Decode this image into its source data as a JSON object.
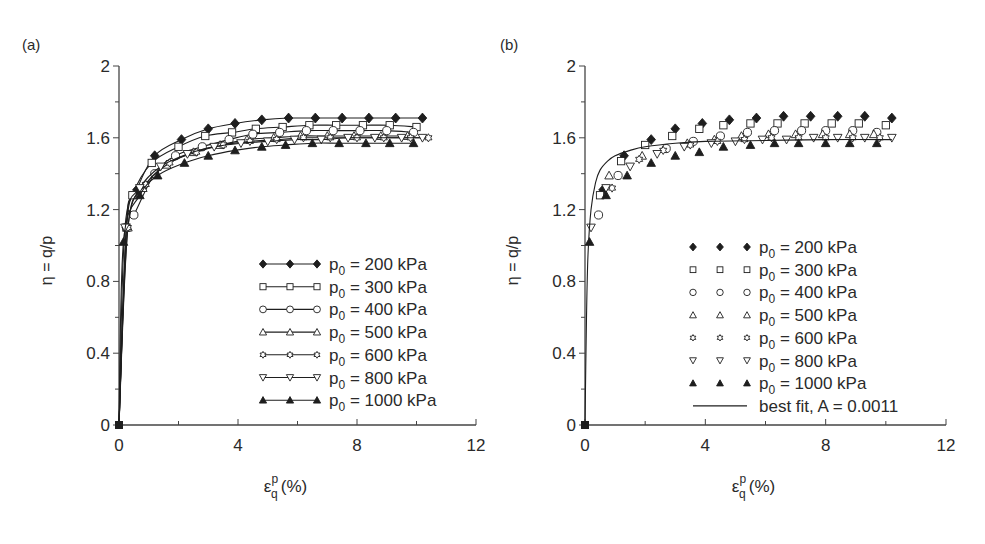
{
  "panels": [
    {
      "id": "a",
      "label": "(a)",
      "legend_style": "line-markers",
      "x_axis_label": "ε",
      "x_axis_sup": "p",
      "x_axis_sub": "q",
      "x_axis_unit": "(%)",
      "y_axis_label": "η = q/p"
    },
    {
      "id": "b",
      "label": "(b)",
      "legend_style": "markers-only",
      "x_axis_label": "ε",
      "x_axis_sup": "p",
      "x_axis_sub": "q",
      "x_axis_unit": "(%)",
      "y_axis_label": "η = q/p"
    }
  ],
  "legend": [
    {
      "marker": "filled-diamond",
      "prefix": "p",
      "sub": "0",
      "text": " = 200 kPa"
    },
    {
      "marker": "open-square",
      "prefix": "p",
      "sub": "0",
      "text": " = 300 kPa"
    },
    {
      "marker": "open-circle",
      "prefix": "p",
      "sub": "0",
      "text": " = 400 kPa"
    },
    {
      "marker": "open-triangle-up",
      "prefix": "p",
      "sub": "0",
      "text": " = 500 kPa"
    },
    {
      "marker": "open-star",
      "prefix": "p",
      "sub": "0",
      "text": " = 600 kPa"
    },
    {
      "marker": "open-triangle-down",
      "prefix": "p",
      "sub": "0",
      "text": " = 800 kPa"
    },
    {
      "marker": "filled-triangle-up",
      "prefix": "p",
      "sub": "0",
      "text": " = 1000 kPa"
    }
  ],
  "best_fit_label": "best fit, A = 0.0011",
  "chart_data": [
    {
      "type": "line",
      "title": "(a)",
      "xlabel": "ε_q^p (%)",
      "ylabel": "η = q/p",
      "xlim": [
        0,
        12
      ],
      "ylim": [
        0,
        2
      ],
      "xticks": [
        0,
        4,
        8,
        12
      ],
      "yticks": [
        0,
        0.4,
        0.8,
        1.2,
        1.6,
        2
      ],
      "grid": false,
      "legend_position": "lower right",
      "series": [
        {
          "name": "p0 = 200 kPa",
          "marker": "filled-diamond",
          "x": [
            0,
            0.25,
            0.6,
            1.2,
            2.1,
            3.0,
            3.9,
            4.8,
            5.7,
            6.6,
            7.5,
            8.4,
            9.3,
            10.2
          ],
          "y": [
            0,
            1.1,
            1.31,
            1.5,
            1.59,
            1.65,
            1.68,
            1.7,
            1.71,
            1.71,
            1.71,
            1.71,
            1.71,
            1.71
          ]
        },
        {
          "name": "p0 = 300 kPa",
          "marker": "open-square",
          "x": [
            0,
            0.25,
            0.45,
            1.1,
            2.0,
            2.9,
            3.8,
            4.6,
            5.5,
            6.4,
            7.3,
            8.2,
            9.1,
            10.0
          ],
          "y": [
            0,
            1.1,
            1.28,
            1.46,
            1.55,
            1.61,
            1.63,
            1.65,
            1.66,
            1.67,
            1.67,
            1.67,
            1.67,
            1.66
          ]
        },
        {
          "name": "p0 = 400 kPa",
          "marker": "open-circle",
          "x": [
            0,
            0.25,
            0.5,
            1.2,
            1.9,
            2.8,
            3.7,
            4.5,
            5.4,
            6.3,
            7.2,
            8.1,
            9.0,
            9.9
          ],
          "y": [
            0,
            1.1,
            1.17,
            1.4,
            1.5,
            1.55,
            1.59,
            1.62,
            1.63,
            1.64,
            1.64,
            1.64,
            1.64,
            1.63
          ]
        },
        {
          "name": "p0 = 500 kPa",
          "marker": "open-triangle-up",
          "x": [
            0,
            0.3,
            0.8,
            1.6,
            2.5,
            3.4,
            4.3,
            5.2,
            6.1,
            7.0,
            7.9,
            8.8,
            9.7
          ],
          "y": [
            0,
            1.1,
            1.32,
            1.45,
            1.52,
            1.56,
            1.59,
            1.6,
            1.61,
            1.61,
            1.61,
            1.61,
            1.61
          ]
        },
        {
          "name": "p0 = 600 kPa",
          "marker": "open-star",
          "x": [
            0,
            0.3,
            0.9,
            1.7,
            2.6,
            3.5,
            4.4,
            5.3,
            6.2,
            7.1,
            8.0,
            8.9,
            9.8,
            10.4
          ],
          "y": [
            0,
            1.1,
            1.34,
            1.46,
            1.52,
            1.56,
            1.58,
            1.59,
            1.6,
            1.6,
            1.6,
            1.6,
            1.6,
            1.6
          ]
        },
        {
          "name": "p0 = 800 kPa",
          "marker": "open-triangle-down",
          "x": [
            0,
            0.2,
            0.7,
            1.4,
            2.3,
            3.2,
            4.1,
            5.0,
            5.9,
            6.8,
            7.7,
            8.6,
            9.5,
            10.2
          ],
          "y": [
            0,
            1.1,
            1.32,
            1.44,
            1.51,
            1.55,
            1.57,
            1.58,
            1.59,
            1.59,
            1.6,
            1.6,
            1.6,
            1.6
          ]
        },
        {
          "name": "p0 = 1000 kPa",
          "marker": "filled-triangle-up",
          "x": [
            0,
            0.15,
            0.7,
            1.3,
            2.2,
            3.0,
            3.9,
            4.8,
            5.6,
            6.5,
            7.4,
            8.3,
            9.1,
            9.9
          ],
          "y": [
            0,
            1.02,
            1.28,
            1.39,
            1.46,
            1.5,
            1.53,
            1.55,
            1.56,
            1.57,
            1.57,
            1.57,
            1.57,
            1.57
          ]
        }
      ]
    },
    {
      "type": "scatter",
      "title": "(b)",
      "xlabel": "ε_q^p (%)",
      "ylabel": "η = q/p",
      "xlim": [
        0,
        12
      ],
      "ylim": [
        0,
        2
      ],
      "xticks": [
        0,
        4,
        8,
        12
      ],
      "yticks": [
        0,
        0.4,
        0.8,
        1.2,
        1.6,
        2
      ],
      "grid": false,
      "legend_position": "lower right",
      "series": [
        {
          "name": "p0 = 200 kPa",
          "marker": "filled-diamond",
          "x": [
            0,
            0.6,
            1.3,
            2.2,
            3.0,
            3.9,
            4.8,
            5.7,
            6.6,
            7.5,
            8.4,
            9.3,
            10.2
          ],
          "y": [
            0,
            1.31,
            1.5,
            1.59,
            1.65,
            1.68,
            1.7,
            1.71,
            1.72,
            1.72,
            1.72,
            1.72,
            1.71
          ]
        },
        {
          "name": "p0 = 300 kPa",
          "marker": "open-square",
          "x": [
            0,
            0.5,
            1.2,
            2.0,
            2.9,
            3.8,
            4.6,
            5.5,
            6.4,
            7.3,
            8.2,
            9.1,
            10.0
          ],
          "y": [
            0,
            1.28,
            1.47,
            1.56,
            1.61,
            1.65,
            1.67,
            1.68,
            1.68,
            1.68,
            1.68,
            1.68,
            1.67
          ]
        },
        {
          "name": "p0 = 400 kPa",
          "marker": "open-circle",
          "x": [
            0,
            0.45,
            1.1,
            2.7,
            3.6,
            4.5,
            5.4,
            6.3,
            7.2,
            8.0,
            8.9,
            9.7
          ],
          "y": [
            0,
            1.17,
            1.39,
            1.54,
            1.58,
            1.61,
            1.63,
            1.64,
            1.64,
            1.64,
            1.64,
            1.63
          ]
        },
        {
          "name": "p0 = 500 kPa",
          "marker": "open-triangle-up",
          "x": [
            0,
            0.8,
            1.9,
            3.4,
            4.3,
            5.2,
            6.1,
            7.0,
            7.9,
            8.8,
            9.6
          ],
          "y": [
            0,
            1.39,
            1.5,
            1.57,
            1.59,
            1.61,
            1.62,
            1.62,
            1.62,
            1.62,
            1.62
          ]
        },
        {
          "name": "p0 = 600 kPa",
          "marker": "open-star",
          "x": [
            0,
            0.9,
            1.8,
            2.6,
            3.5,
            4.4,
            5.3,
            6.2,
            7.1,
            8.0,
            8.9,
            9.8
          ],
          "y": [
            0,
            1.32,
            1.48,
            1.53,
            1.56,
            1.58,
            1.59,
            1.6,
            1.6,
            1.6,
            1.6,
            1.6
          ]
        },
        {
          "name": "p0 = 800 kPa",
          "marker": "open-triangle-down",
          "x": [
            0,
            0.2,
            0.7,
            1.5,
            2.4,
            3.3,
            4.2,
            5.0,
            5.9,
            6.7,
            7.6,
            8.4,
            9.3,
            10.2
          ],
          "y": [
            0,
            1.1,
            1.32,
            1.44,
            1.51,
            1.55,
            1.57,
            1.58,
            1.59,
            1.59,
            1.6,
            1.6,
            1.6,
            1.6
          ]
        },
        {
          "name": "p0 = 1000 kPa",
          "marker": "filled-triangle-up",
          "x": [
            0,
            0.15,
            0.7,
            1.4,
            2.2,
            3.0,
            3.8,
            4.6,
            5.5,
            6.3,
            7.1,
            8.0,
            8.8,
            9.7
          ],
          "y": [
            0,
            1.02,
            1.28,
            1.39,
            1.46,
            1.5,
            1.52,
            1.55,
            1.56,
            1.57,
            1.57,
            1.57,
            1.57,
            1.57
          ]
        },
        {
          "name": "best fit, A = 0.0011",
          "type": "line",
          "x": [
            0,
            0.05,
            0.1,
            0.2,
            0.35,
            0.5,
            0.75,
            1.0,
            1.5,
            2.0,
            3.0,
            4.0,
            6.0,
            8.0,
            10.2
          ],
          "y": [
            0,
            0.6,
            0.95,
            1.2,
            1.35,
            1.42,
            1.47,
            1.5,
            1.53,
            1.55,
            1.57,
            1.58,
            1.585,
            1.59,
            1.59
          ]
        }
      ]
    }
  ]
}
